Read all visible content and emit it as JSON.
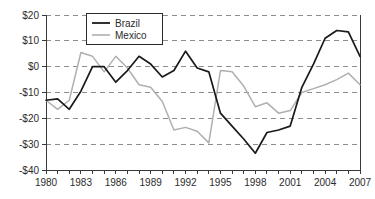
{
  "chart_data": {
    "type": "line",
    "title": "",
    "subtitle": "",
    "xlabel": "",
    "ylabel": "",
    "x": [
      1980,
      1981,
      1982,
      1983,
      1984,
      1985,
      1986,
      1987,
      1988,
      1989,
      1990,
      1991,
      1992,
      1993,
      1994,
      1995,
      1996,
      1997,
      1998,
      1999,
      2000,
      2001,
      2002,
      2003,
      2004,
      2005,
      2006,
      2007
    ],
    "series": [
      {
        "name": "Brazil",
        "color": "#1a1a1a",
        "values": [
          -13,
          -12.5,
          -16.5,
          -9.5,
          0,
          0,
          -6,
          -1.5,
          4,
          1,
          -4,
          -1.5,
          6,
          -0.5,
          -2,
          -18,
          -23,
          -28,
          -33.5,
          -25.5,
          -24.5,
          -23,
          -8,
          1,
          11,
          14,
          13.5,
          4
        ]
      },
      {
        "name": "Mexico",
        "color": "#b0b0b0",
        "values": [
          -13,
          -16.5,
          -13,
          5.5,
          4,
          -2,
          4,
          -0.5,
          -7,
          -8,
          -13.5,
          -24.5,
          -23.5,
          -25,
          -29.5,
          -1.5,
          -2,
          -7.5,
          -15.5,
          -14,
          -18,
          -17,
          -10,
          -8.5,
          -7,
          -5,
          -2.5,
          -7
        ]
      }
    ],
    "xlim": [
      1980,
      2007
    ],
    "ylim": [
      -40,
      20
    ],
    "y_ticks": [
      20,
      10,
      0,
      -10,
      -20,
      -30,
      -40
    ],
    "y_tick_labels": [
      "$20",
      "$10",
      "$0",
      "-$10",
      "-$20",
      "-$30",
      "-$40"
    ],
    "x_ticks": [
      1980,
      1983,
      1986,
      1989,
      1992,
      1995,
      1998,
      2001,
      2004,
      2007
    ],
    "x_tick_labels": [
      "1980",
      "1983",
      "1986",
      "1989",
      "1992",
      "1995",
      "1998",
      "2001",
      "2004",
      "2007"
    ],
    "x_minor_ticks": [
      1980,
      1981,
      1982,
      1983,
      1984,
      1985,
      1986,
      1987,
      1988,
      1989,
      1990,
      1991,
      1992,
      1993,
      1994,
      1995,
      1996,
      1997,
      1998,
      1999,
      2000,
      2001,
      2002,
      2003,
      2004,
      2005,
      2006,
      2007
    ],
    "grid": true,
    "grid_axis": "y",
    "legend_position": "top-left-inside",
    "legend_entries": [
      "Brazil",
      "Mexico"
    ]
  }
}
